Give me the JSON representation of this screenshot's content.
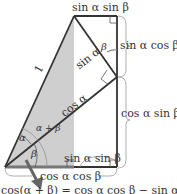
{
  "diagram": {
    "labels": {
      "hypotenuse_one": "1",
      "top_segment": "sin α sin β",
      "right_upper": "sin α cos β",
      "right_lower": "cos α sin β",
      "sin_alpha_side": "sin α",
      "cos_alpha_side": "cos α",
      "bottom_inner": "sin α sin β",
      "bottom_segment": "cos α cos β",
      "angle_alpha": "α",
      "angle_beta": "β",
      "angle_alpha_plus_beta": "α + β",
      "angle_beta_top": "β"
    },
    "formula": "cos(α + β) = cos α cos β − sin α sin β",
    "colors": {
      "line": "#333333",
      "gray_fill": "#cfcfcf",
      "brace": "#9a9a9a",
      "arrow": "#666666",
      "bottom_highlight": "#777777"
    }
  }
}
